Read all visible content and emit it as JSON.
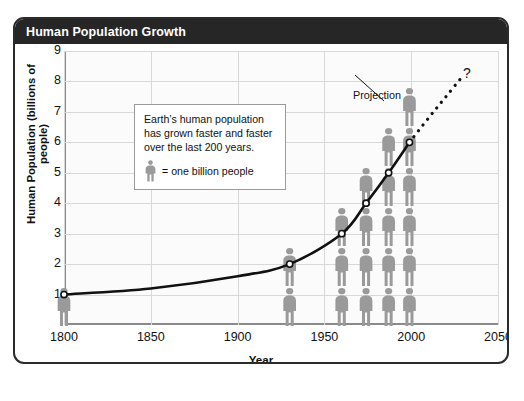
{
  "header": {
    "title": "Human Population Growth"
  },
  "chart_data": {
    "type": "line",
    "title": "Human Population Growth",
    "xlabel": "Year",
    "ylabel": "Human Population (billions of people)",
    "xlim": [
      1800,
      2050
    ],
    "ylim": [
      0,
      9
    ],
    "xticks": [
      1800,
      1850,
      1900,
      1950,
      2000,
      2050
    ],
    "yticks": [
      1,
      2,
      3,
      4,
      5,
      6,
      7,
      8,
      9
    ],
    "grid": true,
    "legend_position": "none",
    "series": [
      {
        "name": "Observed population",
        "style": "solid",
        "markers": "open-circle",
        "x": [
          1800,
          1850,
          1900,
          1930,
          1960,
          1974,
          1987,
          1999
        ],
        "y": [
          1.0,
          1.2,
          1.6,
          2.0,
          3.0,
          4.0,
          5.0,
          6.0
        ]
      },
      {
        "name": "Projection",
        "style": "dotted",
        "x": [
          1999,
          2010,
          2020,
          2030
        ],
        "y": [
          6.0,
          6.8,
          7.5,
          8.2
        ]
      }
    ],
    "pictogram": {
      "unit": "one billion people",
      "columns": [
        {
          "year": 1800,
          "count": 1
        },
        {
          "year": 1930,
          "count": 2
        },
        {
          "year": 1960,
          "count": 3
        },
        {
          "year": 1974,
          "count": 4
        },
        {
          "year": 1987,
          "count": 5
        },
        {
          "year": 1999,
          "count": 6
        }
      ]
    },
    "annotations": [
      {
        "name": "projection-label",
        "text": "Projection"
      },
      {
        "name": "question-mark",
        "text": "?"
      }
    ]
  },
  "callout": {
    "line1": "Earth’s human population",
    "line2": "has  grown faster and faster",
    "line3": "over the last 200 years.",
    "legend_text": "= one billion people"
  },
  "axes": {
    "y_title": "Human Population (billions of people)",
    "x_title": "Year",
    "yticks": [
      "9",
      "8",
      "7",
      "6",
      "5",
      "4",
      "3",
      "2",
      "1"
    ],
    "xticks": [
      "1800",
      "1850",
      "1900",
      "1950",
      "2000",
      "2050"
    ]
  },
  "footer": {
    "source": "SOURCE: U.S. Bureau of the Census"
  },
  "labels": {
    "projection": "Projection",
    "question": "?"
  },
  "colors": {
    "header_bg": "#262626",
    "figure_gray": "#9a9a9a",
    "curve": "#111111",
    "grid": "#d8d8d8"
  }
}
